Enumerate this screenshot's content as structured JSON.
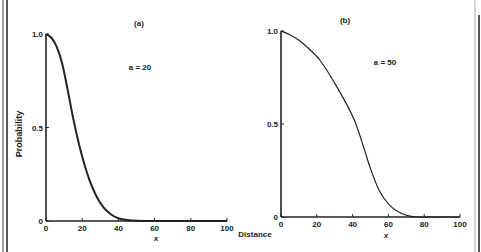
{
  "chart_data": [
    {
      "type": "line",
      "panel_label": "(a)",
      "annotation": "a = 20",
      "xlabel": "x",
      "ylabel": "Probability",
      "xlim": [
        0,
        100
      ],
      "ylim": [
        0,
        1.0
      ],
      "x_ticks": [
        "0",
        "20",
        "40",
        "60",
        "80",
        "100"
      ],
      "y_ticks": [
        "0",
        "0.5",
        "1.0"
      ],
      "grid": false,
      "series": [
        {
          "name": "a = 20",
          "x": [
            0,
            3,
            6,
            9,
            12,
            15,
            18,
            21,
            24,
            28,
            32,
            36,
            40,
            45,
            50,
            55,
            60,
            100
          ],
          "values": [
            1.0,
            0.98,
            0.93,
            0.84,
            0.7,
            0.55,
            0.42,
            0.31,
            0.22,
            0.13,
            0.07,
            0.035,
            0.015,
            0.005,
            0.001,
            0,
            0,
            0
          ]
        }
      ]
    },
    {
      "type": "line",
      "panel_label": "(b)",
      "annotation": "a = 50",
      "xlabel": "x",
      "ylabel": "",
      "xlim": [
        0,
        100
      ],
      "ylim": [
        0,
        1.0
      ],
      "x_ticks": [
        "0",
        "20",
        "40",
        "60",
        "80",
        "100"
      ],
      "y_ticks": [
        "0",
        "0.5",
        "1.0"
      ],
      "grid": false,
      "series": [
        {
          "name": "a = 50",
          "x": [
            0,
            5,
            10,
            15,
            22,
            30,
            37,
            41,
            44,
            47,
            50,
            55,
            61,
            67,
            72,
            78,
            100
          ],
          "values": [
            1.0,
            0.98,
            0.95,
            0.91,
            0.84,
            0.72,
            0.6,
            0.52,
            0.44,
            0.35,
            0.26,
            0.14,
            0.06,
            0.02,
            0.005,
            0,
            0
          ]
        }
      ]
    }
  ],
  "shared_xlabel": "Distance",
  "frame": {
    "ink": "#222222",
    "edge": "#999999"
  }
}
